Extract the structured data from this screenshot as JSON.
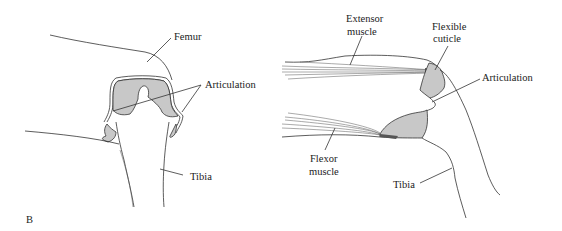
{
  "figure": {
    "panel_label": "B",
    "left_diagram": {
      "labels": {
        "femur": "Femur",
        "articulation": "Articulation",
        "tibia": "Tibia"
      }
    },
    "right_diagram": {
      "labels": {
        "extensor_line1": "Extensor",
        "extensor_line2": "muscle",
        "flexible_line1": "Flexible",
        "flexible_line2": "cuticle",
        "articulation": "Articulation",
        "flexor_line1": "Flexor",
        "flexor_line2": "muscle",
        "tibia": "Tibia"
      }
    },
    "colors": {
      "line": "#333333",
      "shading": "#c8c8c8",
      "background": "#ffffff"
    }
  }
}
